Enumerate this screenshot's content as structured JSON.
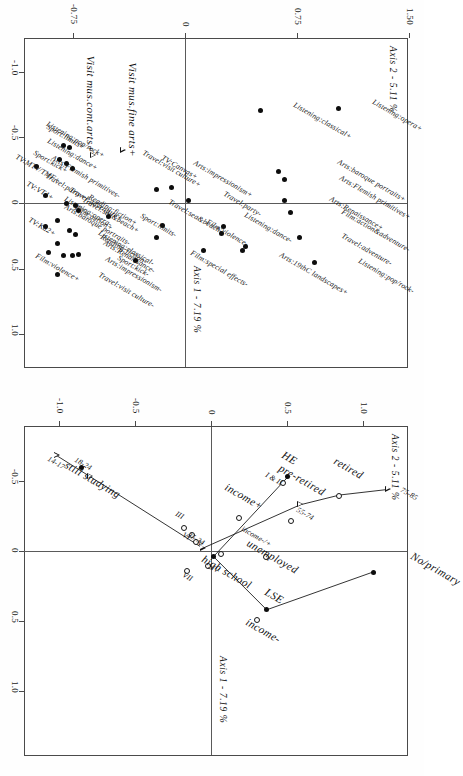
{
  "figure": {
    "orientation": "rotated-90-ccw",
    "panels": [
      "modalities",
      "individuals"
    ]
  },
  "left_panel": {
    "axis_x_label": "Axis 1 - 7.19 %",
    "axis_y_label": "Axis 2 - 5.11 %",
    "x_ticks": [
      "-1.0",
      "-0.5",
      "0",
      "0.5",
      "1.0"
    ],
    "y_ticks": [
      "-0.75",
      "0",
      "0.75",
      "1.50"
    ],
    "special_labels": [
      "Visit mus.fine arts+",
      "Visit mus.cont.arts+"
    ]
  },
  "right_panel": {
    "axis_x_label": "Axis 1 - 7.19 %",
    "axis_y_label": "Axis 2 - 5.11 %",
    "x_ticks": [
      "-0.5",
      "0",
      "0.5",
      "1.0"
    ],
    "y_ticks": [
      "-1.0",
      "-0.5",
      "0",
      "0.5",
      "1.0"
    ]
  },
  "chart_data": [
    {
      "type": "scatter",
      "title": "",
      "panel": "left",
      "xlabel": "Axis 1 - 7.19 %",
      "ylabel": "Axis 2 - 5.11 %",
      "xlim": [
        -1.25,
        1.25
      ],
      "ylim": [
        -1.1,
        1.62
      ],
      "grid": false,
      "legend": "none",
      "points": [
        {
          "label": "Listening:opera+",
          "x": -0.72,
          "y": 1.02,
          "marker": "filled"
        },
        {
          "label": "Listening:classical+",
          "x": -0.7,
          "y": 0.5,
          "marker": "filled"
        },
        {
          "label": "Arts:baroque portraits+",
          "x": -0.24,
          "y": 0.62,
          "marker": "filled"
        },
        {
          "label": "Arts:Flemish primitives+",
          "x": -0.18,
          "y": 0.66,
          "marker": "filled"
        },
        {
          "label": "Arts:Renaissance+",
          "x": -0.02,
          "y": 0.66,
          "marker": "filled"
        },
        {
          "label": "Film:action&adventure-",
          "x": 0.07,
          "y": 0.7,
          "marker": "filled"
        },
        {
          "label": "Travel:adventure-",
          "x": 0.26,
          "y": 0.76,
          "marker": "filled"
        },
        {
          "label": "Listening:pop/rock-",
          "x": 0.45,
          "y": 0.86,
          "marker": "filled"
        },
        {
          "label": "Listening:dance-",
          "x": 0.33,
          "y": 0.4,
          "marker": "filled"
        },
        {
          "label": "Arts:19thC landscapes+",
          "x": 0.36,
          "y": 0.38,
          "marker": "filled"
        },
        {
          "label": "Travel:party-",
          "x": 0.18,
          "y": 0.25,
          "marker": "filled"
        },
        {
          "label": "Film:violence-",
          "x": 0.23,
          "y": 0.24,
          "marker": "filled"
        },
        {
          "label": "Film:special effects-",
          "x": 0.36,
          "y": 0.12,
          "marker": "filled"
        },
        {
          "label": "Arts:impressionism+",
          "x": -0.02,
          "y": 0.02,
          "marker": "filled"
        },
        {
          "label": "TV:Canvas+",
          "x": -0.12,
          "y": -0.1,
          "marker": "filled"
        },
        {
          "label": "Travel:visit culture+",
          "x": -0.1,
          "y": -0.2,
          "marker": "filled"
        },
        {
          "label": "Travel:sea&beach-",
          "x": 0.17,
          "y": -0.16,
          "marker": "filled"
        },
        {
          "label": "Sport:limits-",
          "x": 0.26,
          "y": -0.2,
          "marker": "filled"
        },
        {
          "label": "Sport:kick-",
          "x": 0.44,
          "y": -0.34,
          "marker": "filled"
        },
        {
          "label": "Reading:fiction+",
          "x": 0.1,
          "y": -0.52,
          "marker": "filled"
        },
        {
          "label": "Visit mus.fine arts+",
          "x": -0.4,
          "y": -0.42,
          "marker": "triangle"
        },
        {
          "label": "Visit mus.cont.arts+",
          "x": -0.36,
          "y": -0.62,
          "marker": "triangle"
        }
      ],
      "points2": [
        {
          "label": "Reading:fiction-",
          "x": 0.4,
          "y": -0.82,
          "marker": "filled"
        },
        {
          "label": "Listening:opera-",
          "x": 0.13,
          "y": -0.86,
          "marker": "filled"
        },
        {
          "label": "Listening:classical-",
          "x": 0.31,
          "y": -0.86,
          "marker": "filled"
        },
        {
          "label": "Travel:visit culture-",
          "x": 0.54,
          "y": -0.86,
          "marker": "filled"
        },
        {
          "label": "Travel:sea&beach+",
          "x": 0.21,
          "y": -0.78,
          "marker": "filled"
        },
        {
          "label": "Film:action+",
          "x": 0.24,
          "y": -0.74,
          "marker": "filled"
        },
        {
          "label": "Travel:adventure+",
          "x": 0.06,
          "y": -0.72,
          "marker": "filled"
        },
        {
          "label": "Arts:Renaissance-",
          "x": 0.39,
          "y": -0.72,
          "marker": "filled"
        },
        {
          "label": "Arts:impressionism-",
          "x": 0.4,
          "y": -0.76,
          "marker": "filled"
        },
        {
          "label": "Arts:baroque portraits-",
          "x": 0.02,
          "y": -0.74,
          "marker": "filled"
        },
        {
          "label": "Film:violence+",
          "x": 0.38,
          "y": -0.92,
          "marker": "filled"
        },
        {
          "label": "TV:Ká2+",
          "x": 0.18,
          "y": -0.94,
          "marker": "filled"
        },
        {
          "label": "TV:VT4+",
          "x": -0.06,
          "y": -0.94,
          "marker": "filled"
        },
        {
          "label": "TV:MTV/TMF+",
          "x": -0.28,
          "y": -1.0,
          "marker": "filled"
        },
        {
          "label": "Listening:pop/rock+",
          "x": -0.44,
          "y": -0.82,
          "marker": "filled"
        },
        {
          "label": "Listening:dance+",
          "x": -0.3,
          "y": -0.8,
          "marker": "filled"
        },
        {
          "label": "Sport:limits+",
          "x": -0.42,
          "y": -0.78,
          "marker": "filled"
        },
        {
          "label": "Arts:Flemish primitives-",
          "x": -0.26,
          "y": -0.76,
          "marker": "filled"
        },
        {
          "label": "Travel:party+",
          "x": 0.0,
          "y": -0.8,
          "marker": "filled"
        },
        {
          "label": "Sport:kick+",
          "x": -0.33,
          "y": -0.85,
          "marker": "filled"
        }
      ]
    },
    {
      "type": "scatter",
      "panel": "right",
      "xlabel": "Axis 1 - 7.19 %",
      "ylabel": "Axis 2 - 5.11 %",
      "xlim": [
        -0.78,
        1.28
      ],
      "ylim": [
        -1.22,
        1.28
      ],
      "grid": false,
      "legend": "none",
      "points": [
        {
          "label": "75-85",
          "x": -0.44,
          "y": 1.16,
          "marker": "triangle"
        },
        {
          "label": "retired",
          "x": -0.4,
          "y": 0.84,
          "marker": "hollow"
        },
        {
          "label": "55-74",
          "x": -0.33,
          "y": 0.58,
          "marker": "triangle"
        },
        {
          "label": "pre-retired",
          "x": -0.22,
          "y": 0.52,
          "marker": "hollow"
        },
        {
          "label": "unemployed",
          "x": 0.04,
          "y": 0.36,
          "marker": "hollow"
        },
        {
          "label": "No/primary",
          "x": 0.15,
          "y": 1.06,
          "marker": "filled"
        },
        {
          "label": "LSE",
          "x": 0.42,
          "y": 0.36,
          "marker": "filled"
        },
        {
          "label": "income-",
          "x": 0.49,
          "y": 0.3,
          "marker": "hollow"
        },
        {
          "label": "income-/+",
          "x": 0.02,
          "y": 0.06,
          "marker": "hollow"
        },
        {
          "label": "high school",
          "x": 0.04,
          "y": 0.01,
          "marker": "filled"
        },
        {
          "label": "IV",
          "x": 0.1,
          "y": -0.02,
          "marker": "hollow"
        },
        {
          "label": "VII",
          "x": 0.14,
          "y": -0.16,
          "marker": "hollow"
        },
        {
          "label": "V",
          "x": -0.07,
          "y": -0.1,
          "marker": "hollow"
        },
        {
          "label": "VI",
          "x": -0.12,
          "y": -0.13,
          "marker": "hollow"
        },
        {
          "label": "III",
          "x": -0.17,
          "y": -0.18,
          "marker": "hollow"
        },
        {
          "label": "25-34",
          "x": -0.02,
          "y": -0.06,
          "marker": "triangle"
        },
        {
          "label": "income+",
          "x": -0.24,
          "y": 0.18,
          "marker": "hollow"
        },
        {
          "label": "HE",
          "x": -0.53,
          "y": 0.5,
          "marker": "filled"
        },
        {
          "label": "I & II",
          "x": -0.49,
          "y": 0.47,
          "marker": "hollow"
        },
        {
          "label": "18-24",
          "x": -0.53,
          "y": -0.8,
          "marker": "triangle"
        },
        {
          "label": "still studying",
          "x": -0.6,
          "y": -0.86,
          "marker": "filled"
        },
        {
          "label": "14-17",
          "x": -0.68,
          "y": -1.02,
          "marker": "triangle"
        }
      ],
      "age_trajectory": [
        "14-17",
        "18-24",
        "25-34",
        "55-74",
        "retired",
        "75-85"
      ],
      "education_trajectory": [
        "No/primary",
        "LSE",
        "high school",
        "HE"
      ]
    }
  ]
}
